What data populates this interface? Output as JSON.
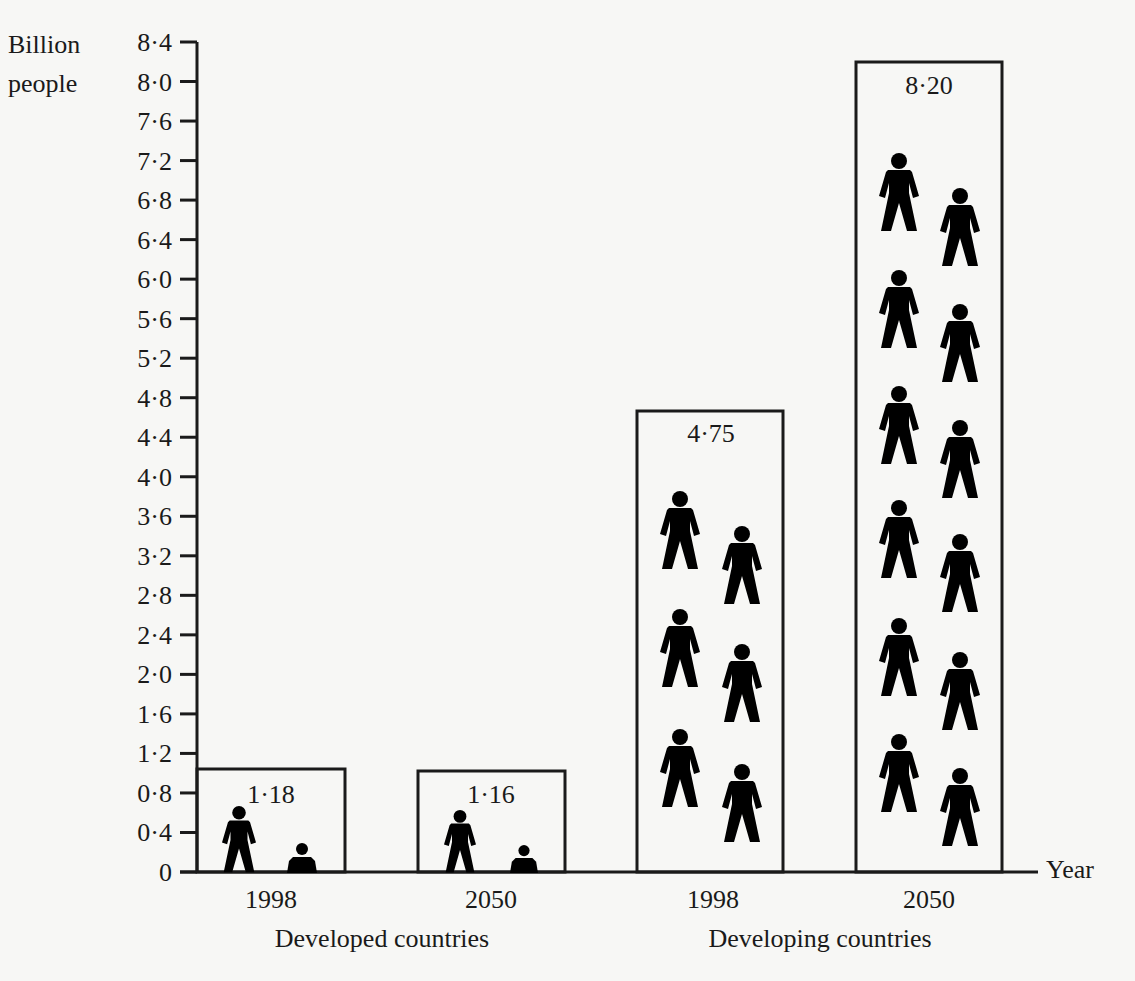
{
  "chart_data": {
    "type": "bar",
    "title": "",
    "ylabel": "Billion people",
    "xlabel": "Year",
    "ylim": [
      0,
      8.4
    ],
    "yticks": [
      "0",
      "0·4",
      "0·8",
      "1·2",
      "1·6",
      "2·0",
      "2·4",
      "2·8",
      "3·2",
      "3·6",
      "4·0",
      "4·4",
      "4·8",
      "5·2",
      "5·6",
      "6·0",
      "6·4",
      "6·8",
      "7·2",
      "7·6",
      "8·0",
      "8·4"
    ],
    "groups": [
      {
        "label": "Developed countries",
        "categories": [
          "1998",
          "2050"
        ]
      },
      {
        "label": "Developing countries",
        "categories": [
          "1998",
          "2050"
        ]
      }
    ],
    "categories": [
      "1998",
      "2050",
      "1998",
      "2050"
    ],
    "values": [
      1.18,
      1.16,
      4.75,
      8.2
    ],
    "value_labels": [
      "1·18",
      "1·16",
      "4·75",
      "8·20"
    ],
    "grid": false,
    "legend": "none",
    "pictograph": "person icons inside each bar"
  },
  "axis": {
    "ylabel_line1": "Billion",
    "ylabel_line2": "people",
    "xlabel": "Year"
  },
  "colors": {
    "ink": "#1a1a1a",
    "background": "#f7f7f5"
  }
}
